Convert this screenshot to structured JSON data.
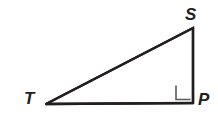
{
  "figure": {
    "name": "right-triangle-STP",
    "canvas": {
      "width": 218,
      "height": 125,
      "background": "#ffffff"
    },
    "stroke": {
      "color": "#231f20",
      "width": 2.4
    },
    "vertices": [
      {
        "id": "S",
        "label": "S",
        "x": 193,
        "y": 28,
        "label_x": 185,
        "label_y": 6
      },
      {
        "id": "T",
        "label": "T",
        "x": 46,
        "y": 104,
        "label_x": 24,
        "label_y": 90
      },
      {
        "id": "P",
        "label": "P",
        "x": 193,
        "y": 103,
        "label_x": 198,
        "label_y": 91
      }
    ],
    "edges": [
      {
        "id": "TS",
        "from": "T",
        "to": "S",
        "role": "hypotenuse"
      },
      {
        "id": "SP",
        "from": "S",
        "to": "P",
        "role": "vertical-leg"
      },
      {
        "id": "TP",
        "from": "T",
        "to": "P",
        "role": "horizontal-leg"
      }
    ],
    "right_angle_marker": {
      "at_vertex": "P",
      "size": 15,
      "x": 176,
      "y": 85,
      "stroke": "#5a5a5a",
      "stroke_width": 1.6
    }
  }
}
